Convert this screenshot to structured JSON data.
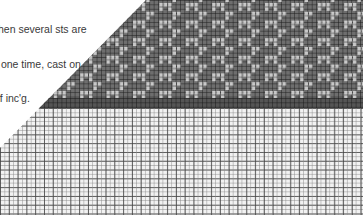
{
  "caption": {
    "lines": [
      "hen several sts are",
      " one time, cast on",
      "of inc'g."
    ]
  },
  "chart_grid": {
    "pattern_region": {
      "color": "#6e6e6e",
      "motif_color": "#e6e6e6",
      "cell_px": 4.4
    },
    "transition_band": {
      "color": "#555555"
    },
    "plain_region": {
      "color": "#f2f2f2",
      "cell_px": 4.4
    }
  }
}
